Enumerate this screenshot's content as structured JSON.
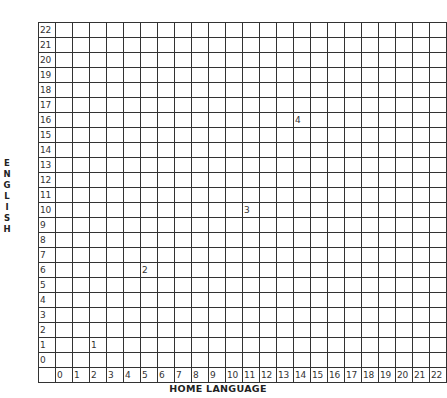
{
  "chart_data": {
    "type": "scatter",
    "title": "",
    "xlabel": "HOME LANGUAGE",
    "ylabel": "ENGLISH",
    "x_ticks": [
      "0",
      "1",
      "2",
      "3",
      "4",
      "5",
      "6",
      "7",
      "8",
      "9",
      "10",
      "11",
      "12",
      "13",
      "14",
      "15",
      "16",
      "17",
      "18",
      "19",
      "20",
      "21",
      "22"
    ],
    "y_ticks": [
      "22",
      "21",
      "20",
      "19",
      "18",
      "17",
      "16",
      "15",
      "14",
      "13",
      "12",
      "11",
      "10",
      "9",
      "8",
      "7",
      "6",
      "5",
      "4",
      "3",
      "2",
      "1",
      "0"
    ],
    "xlim": [
      0,
      22
    ],
    "ylim": [
      0,
      22
    ],
    "grid": true,
    "legend": null,
    "points": [
      {
        "label": "1",
        "x": 2,
        "y": 1
      },
      {
        "label": "2",
        "x": 5,
        "y": 6
      },
      {
        "label": "3",
        "x": 11,
        "y": 10
      },
      {
        "label": "4",
        "x": 14,
        "y": 16
      }
    ]
  }
}
